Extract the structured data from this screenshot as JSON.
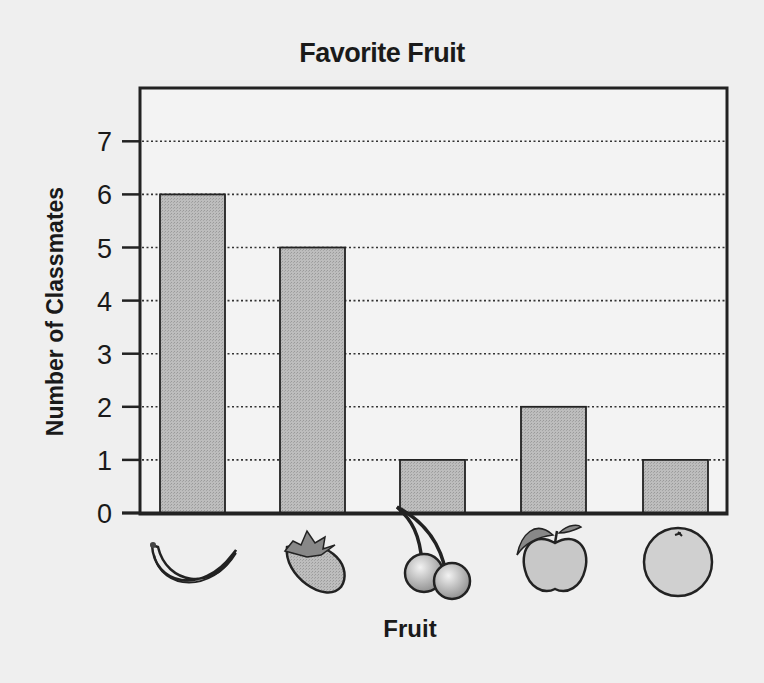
{
  "chart_data": {
    "type": "bar",
    "title": "Favorite Fruit",
    "xlabel": "Fruit",
    "ylabel": "Number of Classmates",
    "categories": [
      "Banana",
      "Strawberry",
      "Cherries",
      "Apple",
      "Orange"
    ],
    "category_icons": [
      "banana-icon",
      "strawberry-icon",
      "cherries-icon",
      "apple-icon",
      "orange-icon"
    ],
    "values": [
      6,
      5,
      1,
      2,
      1
    ],
    "ylim": [
      0,
      7
    ],
    "yticks": [
      0,
      1,
      2,
      3,
      4,
      5,
      6,
      7
    ],
    "grid": "dotted horizontal",
    "legend": null,
    "bar_color": "#b5b5b5"
  }
}
